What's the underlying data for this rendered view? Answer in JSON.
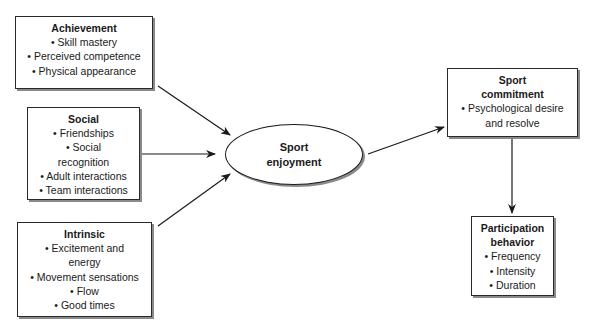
{
  "diagram": {
    "nodes": {
      "achievement": {
        "title": "Achievement",
        "items": [
          "• Skill mastery",
          "• Perceived competence",
          "• Physical appearance"
        ]
      },
      "social": {
        "title": "Social",
        "items": [
          "• Friendships",
          "• Social",
          "recognition",
          "• Adult interactions",
          "• Team interactions"
        ]
      },
      "intrinsic": {
        "title": "Intrinsic",
        "items": [
          "• Excitement and",
          "energy",
          "• Movement sensations",
          "• Flow",
          "• Good times"
        ]
      },
      "enjoyment": {
        "title_lines": [
          "Sport",
          "enjoyment"
        ]
      },
      "commitment": {
        "title_lines": [
          "Sport",
          "commitment"
        ],
        "items": [
          "• Psychological desire",
          "and resolve"
        ]
      },
      "participation": {
        "title_lines": [
          "Participation",
          "behavior"
        ],
        "items": [
          "• Frequency",
          "• Intensity",
          "• Duration"
        ]
      }
    },
    "edges": [
      {
        "from": "achievement",
        "to": "enjoyment"
      },
      {
        "from": "social",
        "to": "enjoyment"
      },
      {
        "from": "intrinsic",
        "to": "enjoyment"
      },
      {
        "from": "enjoyment",
        "to": "commitment"
      },
      {
        "from": "commitment",
        "to": "participation"
      }
    ],
    "colors": {
      "stroke": "#1a1a1a",
      "shadow": "#8a8a8a",
      "fill": "#ffffff"
    }
  }
}
